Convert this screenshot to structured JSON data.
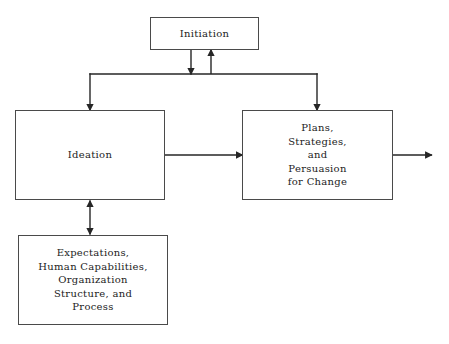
{
  "diagram": {
    "background_color": "#ffffff",
    "stroke_color": "#262626",
    "box_border_color": "#4a4a4a",
    "text_color": "#1c1c1c",
    "nodes": [
      {
        "id": "initiation",
        "label": "Initiation",
        "x": 150,
        "y": 17,
        "width": 109,
        "height": 33
      },
      {
        "id": "ideation",
        "label": "Ideation",
        "x": 15,
        "y": 110,
        "width": 150,
        "height": 90
      },
      {
        "id": "plans",
        "label": "Plans,\nStrategies,\nand\nPersuasion\nfor Change",
        "x": 242,
        "y": 110,
        "width": 151,
        "height": 90
      },
      {
        "id": "expectations",
        "label": "Expectations,\nHuman Capabilities,\nOrganization\nStructure, and\nProcess",
        "x": 18,
        "y": 235,
        "width": 150,
        "height": 90
      }
    ],
    "connectors": [
      {
        "id": "initiation-to-bar",
        "from": "initiation",
        "to": "distribution-bar",
        "direction": "down",
        "arrowheads": 1
      },
      {
        "id": "bar-to-initiation",
        "from": "distribution-bar",
        "to": "initiation",
        "direction": "up",
        "arrowheads": 1
      },
      {
        "id": "bar-to-ideation",
        "from": "distribution-bar",
        "to": "ideation",
        "direction": "down",
        "arrowheads": 1
      },
      {
        "id": "bar-to-plans",
        "from": "distribution-bar",
        "to": "plans",
        "direction": "down",
        "arrowheads": 1
      },
      {
        "id": "ideation-to-plans",
        "from": "ideation",
        "to": "plans",
        "direction": "right",
        "arrowheads": 1
      },
      {
        "id": "ideation-expectations",
        "from": "ideation",
        "to": "expectations",
        "direction": "both",
        "arrowheads": 2
      },
      {
        "id": "plans-output",
        "from": "plans",
        "to": "output",
        "direction": "right",
        "arrowheads": 1
      }
    ]
  }
}
